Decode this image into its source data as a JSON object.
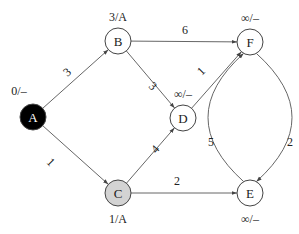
{
  "diagram": {
    "type": "weighted-directed-graph",
    "nodes": [
      {
        "id": "A",
        "label": "A",
        "distance_label": "0/–",
        "style": "source",
        "fill": "#000000",
        "text_color": "#ffffff"
      },
      {
        "id": "B",
        "label": "B",
        "distance_label": "3/A",
        "style": "normal",
        "fill": "#ffffff",
        "text_color": "#222222"
      },
      {
        "id": "C",
        "label": "C",
        "distance_label": "1/A",
        "style": "visited",
        "fill": "#d3d3d3",
        "text_color": "#222222"
      },
      {
        "id": "D",
        "label": "D",
        "distance_label": "∞/–",
        "style": "normal",
        "fill": "#ffffff",
        "text_color": "#222222"
      },
      {
        "id": "E",
        "label": "E",
        "distance_label": "∞/–",
        "style": "normal",
        "fill": "#ffffff",
        "text_color": "#222222"
      },
      {
        "id": "F",
        "label": "F",
        "distance_label": "∞/–",
        "style": "normal",
        "fill": "#ffffff",
        "text_color": "#222222"
      }
    ],
    "edges": [
      {
        "from": "A",
        "to": "B",
        "weight": "3"
      },
      {
        "from": "A",
        "to": "C",
        "weight": "1"
      },
      {
        "from": "B",
        "to": "F",
        "weight": "6"
      },
      {
        "from": "B",
        "to": "D",
        "weight": "3"
      },
      {
        "from": "C",
        "to": "D",
        "weight": "4"
      },
      {
        "from": "C",
        "to": "E",
        "weight": "2"
      },
      {
        "from": "D",
        "to": "F",
        "weight": "1"
      },
      {
        "from": "E",
        "to": "F",
        "weight": "5"
      },
      {
        "from": "F",
        "to": "E",
        "weight": "2"
      }
    ]
  }
}
